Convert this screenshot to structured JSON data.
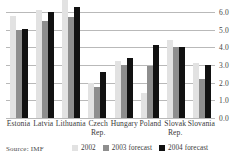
{
  "chart_data": {
    "type": "bar",
    "title": "",
    "xlabel": "",
    "ylabel": "",
    "ylim": [
      0.0,
      6.0
    ],
    "yticks": [
      "0.0",
      "1.0",
      "2.0",
      "3.0",
      "4.0",
      "5.0",
      "6.0"
    ],
    "grid": true,
    "legend_position": "bottom",
    "categories": [
      "Estonia",
      "Latvia",
      "Lithuania",
      "Czech Rep.",
      "Hungary",
      "Poland",
      "Slovak Rep.",
      "Slovania"
    ],
    "category_lines": [
      {
        "l1": "Estonia",
        "l2": ""
      },
      {
        "l1": "Latvia",
        "l2": ""
      },
      {
        "l1": "Lithuania",
        "l2": ""
      },
      {
        "l1": "Czech",
        "l2": "Rep."
      },
      {
        "l1": "Hungary",
        "l2": ""
      },
      {
        "l1": "Poland",
        "l2": ""
      },
      {
        "l1": "Slovak",
        "l2": "Rep."
      },
      {
        "l1": "Slovania",
        "l2": ""
      }
    ],
    "series": [
      {
        "name": "2002",
        "color": "#e2e2e2",
        "values": [
          5.8,
          6.1,
          6.8,
          2.0,
          3.25,
          1.4,
          4.4,
          3.1
        ]
      },
      {
        "name": "2003 forecast",
        "color": "#8e8e8e",
        "values": [
          5.0,
          5.5,
          5.7,
          1.75,
          3.0,
          2.95,
          4.0,
          2.2
        ]
      },
      {
        "name": "2004 forecast",
        "color": "#111111",
        "values": [
          5.05,
          6.0,
          6.3,
          2.6,
          3.4,
          4.15,
          4.0,
          3.0
        ]
      }
    ],
    "source": "Source: IMF"
  },
  "colors": {
    "series_2002": "#e2e2e2",
    "series_2003": "#8e8e8e",
    "series_2004": "#111111",
    "gridline": "#b9b9b9",
    "text": "#3a3a3a"
  }
}
